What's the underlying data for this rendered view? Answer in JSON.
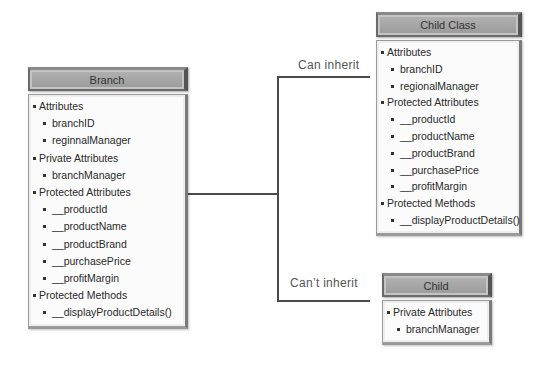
{
  "classes": {
    "branch": {
      "title": "Branch",
      "items": [
        {
          "level": 1,
          "text": "Attributes"
        },
        {
          "level": 2,
          "text": "branchID"
        },
        {
          "level": 2,
          "text": "reginnalManager"
        },
        {
          "level": 1,
          "text": "Private Attributes"
        },
        {
          "level": 2,
          "text": "branchManager"
        },
        {
          "level": 1,
          "text": "Protected Attributes"
        },
        {
          "level": 2,
          "text": "__productId"
        },
        {
          "level": 2,
          "text": "__productName"
        },
        {
          "level": 2,
          "text": "__productBrand"
        },
        {
          "level": 2,
          "text": "__purchasePrice"
        },
        {
          "level": 2,
          "text": "__profitMargin"
        },
        {
          "level": 1,
          "text": "Protected Methods"
        },
        {
          "level": 2,
          "text": "__displayProductDetails()"
        }
      ]
    },
    "child_class": {
      "title": "Child Class",
      "items": [
        {
          "level": 1,
          "text": "Attributes"
        },
        {
          "level": 2,
          "text": "branchID"
        },
        {
          "level": 2,
          "text": "regionalManager"
        },
        {
          "level": 1,
          "text": "Protected Attributes"
        },
        {
          "level": 2,
          "text": "__productId"
        },
        {
          "level": 2,
          "text": "__productName"
        },
        {
          "level": 2,
          "text": "__productBrand"
        },
        {
          "level": 2,
          "text": "__purchasePrice"
        },
        {
          "level": 2,
          "text": "__profitMargin"
        },
        {
          "level": 1,
          "text": "Protected Methods"
        },
        {
          "level": 2,
          "text": "__displayProductDetails()"
        }
      ]
    },
    "child": {
      "title": "Child",
      "items": [
        {
          "level": 1,
          "text": "Private Attributes"
        },
        {
          "level": 2,
          "text": "branchManager"
        }
      ]
    }
  },
  "connectors": {
    "can_inherit": "Can inherit",
    "cant_inherit": "Can’t inherit"
  }
}
